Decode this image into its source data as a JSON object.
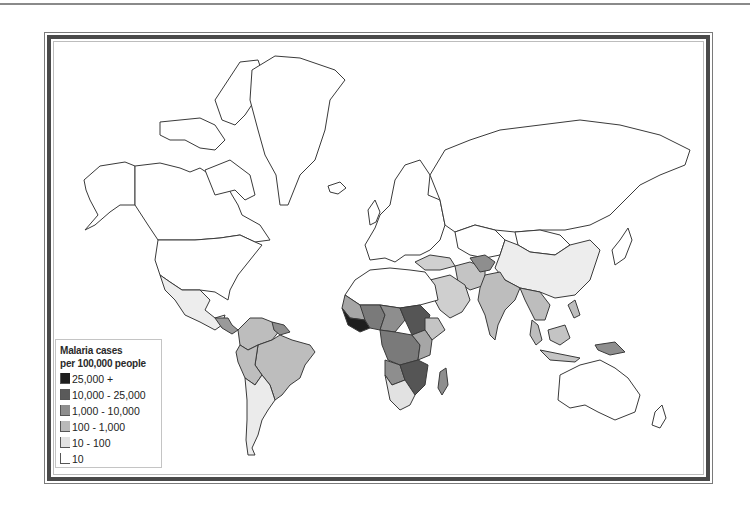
{
  "map": {
    "subject": "Malaria cases per 100,000 people (world choropleth)",
    "colors": {
      "ocean": "#ffffff",
      "border": "#3a3a3a",
      "frame_dark": "#4a4a4a"
    }
  },
  "legend": {
    "title_line1": "Malaria cases",
    "title_line2": "per 100,000 people",
    "items": [
      {
        "label": "25,000 +",
        "color": "#1e1e1e"
      },
      {
        "label": "10,000 - 25,000",
        "color": "#5a5a5a"
      },
      {
        "label": "1,000 - 10,000",
        "color": "#8e8e8e"
      },
      {
        "label": "100 - 1,000",
        "color": "#b9b9b9"
      },
      {
        "label": "10 - 100",
        "color": "#e2e2e2"
      },
      {
        "label": "10",
        "color": "#ffffff"
      }
    ]
  },
  "regions": [
    {
      "name": "North America",
      "class": "10"
    },
    {
      "name": "Greenland",
      "class": "10"
    },
    {
      "name": "Central America",
      "class": "10 - 100"
    },
    {
      "name": "South America (Brazil, Peru, Bolivia, Colombia)",
      "class": "100 - 1,000"
    },
    {
      "name": "Argentina/Chile",
      "class": "10 - 100"
    },
    {
      "name": "Europe",
      "class": "10"
    },
    {
      "name": "Russia",
      "class": "10"
    },
    {
      "name": "North Africa",
      "class": "10"
    },
    {
      "name": "West Africa coast",
      "class": "25,000 +"
    },
    {
      "name": "Sudan / Central Africa",
      "class": "10,000 - 25,000"
    },
    {
      "name": "Sub-Saharan Africa",
      "class": "1,000 - 10,000"
    },
    {
      "name": "Mozambique / Zambia / Malawi",
      "class": "10,000 - 25,000"
    },
    {
      "name": "Southern Africa",
      "class": "10 - 100"
    },
    {
      "name": "Madagascar",
      "class": "1,000 - 10,000"
    },
    {
      "name": "Arabian Peninsula / Iran",
      "class": "100 - 1,000"
    },
    {
      "name": "Afghanistan",
      "class": "1,000 - 10,000"
    },
    {
      "name": "India",
      "class": "100 - 1,000"
    },
    {
      "name": "China",
      "class": "10 - 100"
    },
    {
      "name": "Southeast Asia",
      "class": "100 - 1,000"
    },
    {
      "name": "Papua New Guinea",
      "class": "1,000 - 10,000"
    },
    {
      "name": "Australia",
      "class": "10"
    }
  ]
}
